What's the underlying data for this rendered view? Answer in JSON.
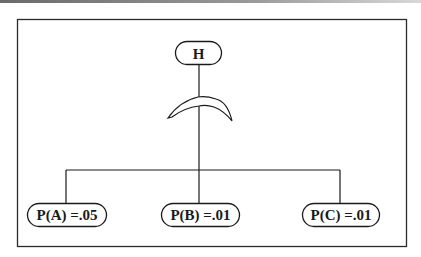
{
  "diagram": {
    "type": "tree",
    "root": {
      "id": "H",
      "label": "H"
    },
    "connector_symbol": "arc",
    "children": [
      {
        "id": "A",
        "label": "P(A) =.05"
      },
      {
        "id": "B",
        "label": "P(B) =.01"
      },
      {
        "id": "C",
        "label": "P(C) =.01"
      }
    ],
    "colors": {
      "stroke": "#1a1a1a",
      "background": "#ffffff"
    }
  }
}
